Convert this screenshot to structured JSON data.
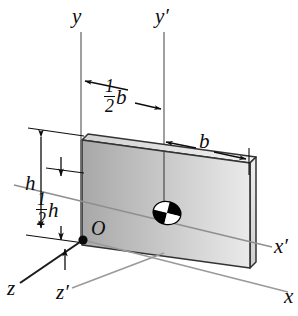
{
  "figure": {
    "background_color": "#ffffff",
    "line_color": "#0d0d0d",
    "axis_line_color": "#8c8c8c",
    "plate_fill_light": "#e8e8e8",
    "plate_fill_dark": "#a6a6a6",
    "plate_edge_color": "#2b2b2b"
  },
  "axes": [
    {
      "id": "y",
      "label": "y",
      "prime": false,
      "orientation": "vertical-up",
      "through": "origin O"
    },
    {
      "id": "y-prime",
      "label": "y",
      "prime": true,
      "orientation": "vertical-up",
      "through": "centroid"
    },
    {
      "id": "x",
      "label": "x",
      "prime": false,
      "orientation": "horizontal-right-depth",
      "through": "origin O"
    },
    {
      "id": "x-prime",
      "label": "x",
      "prime": true,
      "orientation": "horizontal-right-depth",
      "through": "centroid"
    },
    {
      "id": "z",
      "label": "z",
      "prime": false,
      "orientation": "oblique-down-left",
      "through": "origin O"
    },
    {
      "id": "z-prime",
      "label": "z",
      "prime": true,
      "orientation": "oblique-down-left",
      "through": "centroid"
    }
  ],
  "axis_labels": {
    "y": "y",
    "y_prime": "y",
    "x": "x",
    "x_prime": "x",
    "z": "z",
    "z_prime": "z",
    "prime_mark": "′"
  },
  "origin": {
    "label": "O",
    "marker": "filled-dot",
    "position_description": "lower-left corner of the plate"
  },
  "centroid": {
    "marker": "centroid-symbol",
    "description": "ellipse divided into alternating black and white quadrants"
  },
  "dimensions": [
    {
      "id": "half-b",
      "numerator": "1",
      "denominator": "2",
      "symbol": "b",
      "text": "1/2 b",
      "arrows": "both",
      "span": "from y axis to y' axis",
      "meaning": "half the plate width"
    },
    {
      "id": "full-b",
      "numerator": "",
      "denominator": "",
      "symbol": "b",
      "text": "b",
      "arrows": "both",
      "span": "from y' axis to right edge of plate",
      "meaning": "plate width"
    },
    {
      "id": "full-h",
      "numerator": "",
      "denominator": "",
      "symbol": "h",
      "text": "h",
      "arrows": "both",
      "span": "from top edge of plate to bottom edge of plate",
      "meaning": "plate height"
    },
    {
      "id": "half-h",
      "numerator": "1",
      "denominator": "2",
      "symbol": "h",
      "text": "1/2 h",
      "arrows": "both",
      "span": "from x' axis level to bottom edge of plate",
      "meaning": "half the plate height"
    }
  ]
}
